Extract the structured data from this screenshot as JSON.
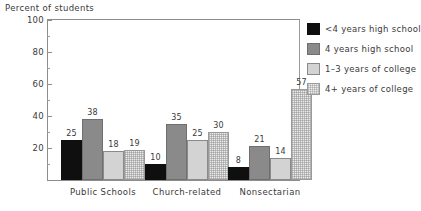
{
  "chart_data": {
    "type": "bar",
    "title": "",
    "ylabel": "Percent of students",
    "xlabel": "",
    "ylim": [
      0,
      100
    ],
    "ytick_labels": [
      "20",
      "40",
      "60",
      "80",
      "100"
    ],
    "ytick_values": [
      20,
      40,
      60,
      80,
      100
    ],
    "yminor_values": [
      10,
      30,
      50,
      70,
      90
    ],
    "grid": false,
    "legend_position": "right",
    "categories": [
      "Public Schools",
      "Church-related",
      "Nonsectarian"
    ],
    "series": [
      {
        "name": "<4 years high school",
        "color": "#0f0f0f",
        "values": [
          25,
          10,
          8
        ]
      },
      {
        "name": "4 years high school",
        "color": "#8a8a8a",
        "values": [
          38,
          35,
          21
        ]
      },
      {
        "name": "1–3 years of college",
        "color": "#d3d3d3",
        "values": [
          18,
          25,
          14
        ]
      },
      {
        "name": "4+ years of college",
        "color": "#ececec",
        "values": [
          19,
          30,
          57
        ]
      }
    ]
  }
}
